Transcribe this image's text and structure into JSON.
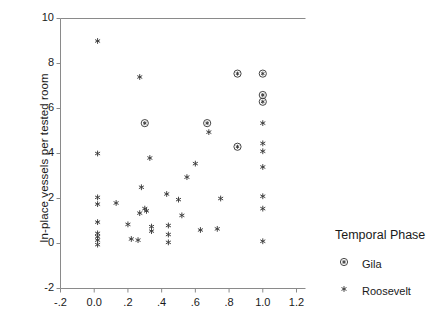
{
  "chart_data": {
    "type": "scatter",
    "title": "",
    "xlabel": "",
    "ylabel": "In-place vessels per tested room",
    "xlim": [
      -0.2,
      1.2
    ],
    "ylim": [
      -2,
      10
    ],
    "xticks": [
      -0.2,
      0.0,
      0.2,
      0.4,
      0.6,
      0.8,
      1.0,
      1.2
    ],
    "xticklabels": [
      "-.2",
      "0.0",
      ".2",
      ".4",
      ".6",
      ".8",
      "1.0",
      "1.2"
    ],
    "yticks": [
      -2,
      0,
      2,
      4,
      6,
      8,
      10
    ],
    "yticklabels": [
      "-2",
      "0",
      "2",
      "4",
      "6",
      "8",
      "10"
    ],
    "grid": false,
    "legend_position": "right",
    "legend_title": "Temporal Phase",
    "series": [
      {
        "name": "Gila",
        "marker": "circled-asterisk",
        "points": [
          [
            0.3,
            5.35
          ],
          [
            0.67,
            5.35
          ],
          [
            0.85,
            7.55
          ],
          [
            0.85,
            4.3
          ],
          [
            1.0,
            7.55
          ],
          [
            1.0,
            6.6
          ],
          [
            1.0,
            6.3
          ]
        ]
      },
      {
        "name": "Roosevelt",
        "marker": "asterisk",
        "points": [
          [
            0.02,
            9.0
          ],
          [
            0.02,
            4.0
          ],
          [
            0.02,
            2.05
          ],
          [
            0.02,
            1.75
          ],
          [
            0.02,
            0.95
          ],
          [
            0.02,
            0.45
          ],
          [
            0.02,
            0.3
          ],
          [
            0.02,
            0.15
          ],
          [
            0.02,
            -0.05
          ],
          [
            0.13,
            1.8
          ],
          [
            0.2,
            0.85
          ],
          [
            0.22,
            0.2
          ],
          [
            0.26,
            0.15
          ],
          [
            0.27,
            1.35
          ],
          [
            0.27,
            7.4
          ],
          [
            0.28,
            2.5
          ],
          [
            0.3,
            1.55
          ],
          [
            0.31,
            1.45
          ],
          [
            0.33,
            3.8
          ],
          [
            0.34,
            0.75
          ],
          [
            0.34,
            0.55
          ],
          [
            0.43,
            2.2
          ],
          [
            0.44,
            0.8
          ],
          [
            0.44,
            0.4
          ],
          [
            0.44,
            0.05
          ],
          [
            0.5,
            1.95
          ],
          [
            0.52,
            1.25
          ],
          [
            0.55,
            2.95
          ],
          [
            0.6,
            3.55
          ],
          [
            0.63,
            0.6
          ],
          [
            0.68,
            4.95
          ],
          [
            0.73,
            0.65
          ],
          [
            0.75,
            2.0
          ],
          [
            1.0,
            5.35
          ],
          [
            1.0,
            4.45
          ],
          [
            1.0,
            4.1
          ],
          [
            1.0,
            3.4
          ],
          [
            1.0,
            2.1
          ],
          [
            1.0,
            1.55
          ],
          [
            1.0,
            0.1
          ]
        ]
      }
    ]
  },
  "legend": {
    "title": "Temporal Phase",
    "entries": [
      {
        "label": "Gila",
        "marker": "circled-asterisk"
      },
      {
        "label": "Roosevelt",
        "marker": "asterisk"
      }
    ]
  }
}
